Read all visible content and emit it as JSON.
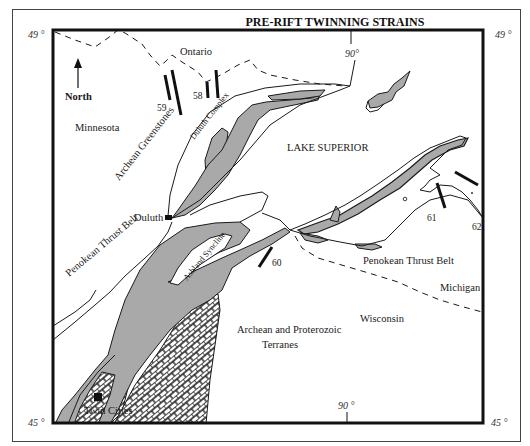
{
  "title": "PRE-RIFT TWINNING STRAINS",
  "colors": {
    "frame": "#111111",
    "outer_box": "#444444",
    "gray_unit": "#a9a9a9",
    "line": "#1a1a1a",
    "background": "#ffffff"
  },
  "latitude_labels": {
    "top_left": "49 °",
    "top_right": "49 °",
    "bottom_left": "45 °",
    "bottom_right": "45 °"
  },
  "longitude_labels": {
    "top": "90°",
    "bottom": "90 °"
  },
  "north_arrow": {
    "label": "North",
    "icon": "north-arrow-icon"
  },
  "regions": {
    "ontario": "Ontario",
    "minnesota": "Minnesota",
    "lake_superior": "LAKE SUPERIOR",
    "wisconsin": "Wisconsin",
    "michigan": "Michigan",
    "terranes_line1": "Archean and Proterozoic",
    "terranes_line2": "Terranes"
  },
  "geologic_features": {
    "archean_greenstones": "Archean Greenstones",
    "duluth_complex": "Duluth Complex",
    "penokean_west": "Penokean Thrust Belt",
    "penokean_east": "Penokean Thrust Belt",
    "ashland_syncline": "Ashland Syncline"
  },
  "cities": {
    "duluth": "Duluth",
    "twin_cities": "Twin Cities"
  },
  "strain_sites": [
    {
      "id": "58",
      "label": "58"
    },
    {
      "id": "59",
      "label": "59"
    },
    {
      "id": "60",
      "label": "60"
    },
    {
      "id": "61",
      "label": "61"
    },
    {
      "id": "62",
      "label": "62"
    }
  ]
}
